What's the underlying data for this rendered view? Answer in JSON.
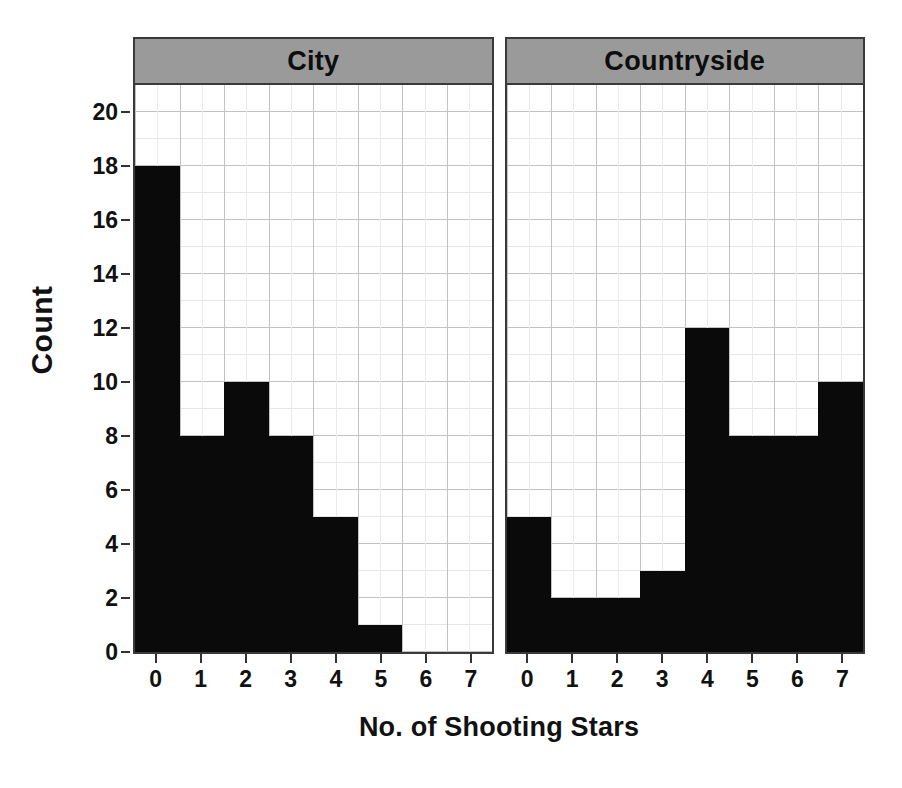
{
  "chart_data": {
    "type": "bar",
    "title": "",
    "xlabel": "No. of Shooting Stars",
    "ylabel": "Count",
    "xlim": [
      -0.5,
      7.5
    ],
    "ylim": [
      0,
      21
    ],
    "yticks": [
      0,
      2,
      4,
      6,
      8,
      10,
      12,
      14,
      16,
      18,
      20
    ],
    "xticks": [
      0,
      1,
      2,
      3,
      4,
      5,
      6,
      7
    ],
    "categories": [
      "0",
      "1",
      "2",
      "3",
      "4",
      "5",
      "6",
      "7"
    ],
    "grid": true,
    "legend": "none",
    "facets": [
      {
        "label": "City",
        "values": [
          18,
          8,
          10,
          8,
          5,
          1,
          0,
          0
        ]
      },
      {
        "label": "Countryside",
        "values": [
          5,
          2,
          2,
          3,
          12,
          8,
          8,
          10
        ]
      }
    ],
    "colors": {
      "bar": "#0a0a0a",
      "panel_header": "#9a9a9a",
      "grid_major": "#c2c2c2",
      "grid_minor": "#e6e6e6",
      "frame": "#3a3a3a",
      "background": "#ffffff",
      "text": "#111111"
    }
  }
}
